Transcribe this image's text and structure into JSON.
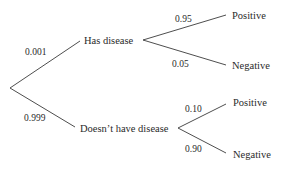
{
  "diagram": {
    "type": "probability-tree",
    "root": {
      "branches": [
        {
          "probability": "0.001",
          "label": "Has disease",
          "branches": [
            {
              "probability": "0.95",
              "label": "Positive"
            },
            {
              "probability": "0.05",
              "label": "Negative"
            }
          ]
        },
        {
          "probability": "0.999",
          "label": "Doesn’t have disease",
          "branches": [
            {
              "probability": "0.10",
              "label": "Positive"
            },
            {
              "probability": "0.90",
              "label": "Negative"
            }
          ]
        }
      ]
    },
    "colors": {
      "line": "#3a3a3a",
      "text": "#2a2a2a",
      "background": "#ffffff"
    }
  }
}
